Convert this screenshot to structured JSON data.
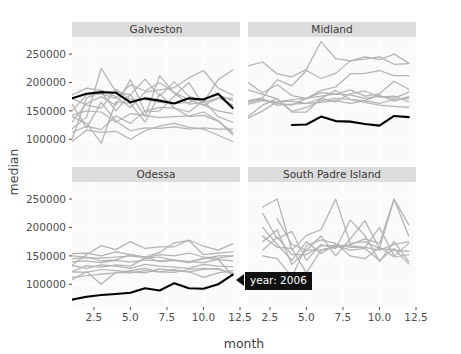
{
  "chart_data": {
    "type": "line",
    "title": "",
    "xlabel": "month",
    "ylabel": "median",
    "xlim": [
      1,
      12.5
    ],
    "ylim": [
      60000,
      280000
    ],
    "xticks": [
      "2.5",
      "5.0",
      "7.5",
      "10.0",
      "12.5"
    ],
    "xtick_values": [
      2.5,
      5.0,
      7.5,
      10.0,
      12.5
    ],
    "yticks": [
      "100000",
      "150000",
      "200000",
      "250000"
    ],
    "ytick_values": [
      100000,
      150000,
      200000,
      250000
    ],
    "grid": true,
    "legend": "none",
    "facet_layout": "2x2",
    "highlight_series": "2006",
    "highlight_color": "#000000",
    "other_series_color": "#b3b3b3",
    "panel_background": "#fafafa",
    "strip_background": "#dcdcdc",
    "x": [
      1,
      2,
      3,
      4,
      5,
      6,
      7,
      8,
      9,
      10,
      11,
      12
    ],
    "panels": [
      {
        "name": "Galveston",
        "series": [
          {
            "name": "2006",
            "highlight": true,
            "values": [
              172000,
              180000,
              183000,
              182000,
              165000,
              172000,
              168000,
              163000,
              172000,
              170000,
              180000,
              155000
            ]
          },
          {
            "name": "y1",
            "highlight": false,
            "values": [
              150000,
              178000,
              180000,
              172000,
              196000,
              185000,
              200000,
              182000,
              170000,
              160000,
              172000,
              172000
            ]
          },
          {
            "name": "y2",
            "highlight": false,
            "values": [
              118000,
              139000,
              225000,
              184000,
              178000,
              206000,
              176000,
              201000,
              176000,
              165000,
              205000,
              222000
            ]
          },
          {
            "name": "y3",
            "highlight": false,
            "values": [
              178000,
              190000,
              186000,
              175000,
              156000,
              183000,
              187000,
              191000,
              208000,
              221000,
              190000,
              178000
            ]
          },
          {
            "name": "y4",
            "highlight": false,
            "values": [
              112000,
              123000,
              117000,
              141000,
              128000,
              150000,
              156000,
              155000,
              140000,
              142000,
              132000,
              112000
            ]
          },
          {
            "name": "y5",
            "highlight": false,
            "values": [
              96000,
              116000,
              112000,
              114000,
              100000,
              115000,
              123000,
              128000,
              121000,
              118000,
              107000,
              96000
            ]
          },
          {
            "name": "y6",
            "highlight": false,
            "values": [
              140000,
              128000,
              93000,
              166000,
              163000,
              130000,
              180000,
              155000,
              148000,
              168000,
              140000,
              130000
            ]
          },
          {
            "name": "y7",
            "highlight": false,
            "values": [
              130000,
              163000,
              175000,
              160000,
              205000,
              148000,
              150000,
              176000,
              200000,
              160000,
              150000,
              145000
            ]
          },
          {
            "name": "y8",
            "highlight": false,
            "values": [
              162000,
              120000,
              165000,
              132000,
              115000,
              120000,
              119000,
              122000,
              118000,
              120000,
              118000,
              118000
            ]
          },
          {
            "name": "y9",
            "highlight": false,
            "values": [
              100000,
              173000,
              183000,
              150000,
              179000,
              140000,
              212000,
              181000,
              162000,
              165000,
              173000,
              160000
            ]
          },
          {
            "name": "y10",
            "highlight": false,
            "values": [
              172000,
              160000,
              155000,
              188000,
              170000,
              170000,
              165000,
              163000,
              165000,
              172000,
              178000,
              168000
            ]
          },
          {
            "name": "y11",
            "highlight": false,
            "values": [
              142000,
              150000,
              148000,
              130000,
              145000,
              142000,
              138000,
              140000,
              141000,
              148000,
              133000,
              108000
            ]
          }
        ]
      },
      {
        "name": "Midland",
        "series": [
          {
            "name": "2006",
            "highlight": true,
            "start_month": 4,
            "values": [
              null,
              null,
              null,
              125000,
              126000,
              140000,
              132000,
              131000,
              127000,
              124000,
              141000,
              139000
            ]
          },
          {
            "name": "y1",
            "highlight": false,
            "values": [
              229000,
              236000,
              215000,
              210000,
              223000,
              272000,
              242000,
              238000,
              241000,
              245000,
              232000,
              233000
            ]
          },
          {
            "name": "y2",
            "highlight": false,
            "values": [
              168000,
              173000,
              205000,
              194000,
              221000,
              207000,
              216000,
              238000,
              245000,
              240000,
              250000,
              234000
            ]
          },
          {
            "name": "y3",
            "highlight": false,
            "values": [
              200000,
              182000,
              196000,
              177000,
              172000,
              186000,
              192000,
              215000,
              216000,
              221000,
              212000,
              212000
            ]
          },
          {
            "name": "y4",
            "highlight": false,
            "values": [
              165000,
              170000,
              163000,
              160000,
              172000,
              182000,
              179000,
              187000,
              176000,
              180000,
              202000,
              188000
            ]
          },
          {
            "name": "y5",
            "highlight": false,
            "values": [
              162000,
              168000,
              166000,
              170000,
              172000,
              176000,
              180000,
              178000,
              172000,
              176000,
              172000,
              183000
            ]
          },
          {
            "name": "y6",
            "highlight": false,
            "values": [
              140000,
              160000,
              172000,
              149000,
              156000,
              168000,
              172000,
              170000,
              168000,
              178000,
              167000,
              175000
            ]
          },
          {
            "name": "y7",
            "highlight": false,
            "values": [
              187000,
              179000,
              171000,
              148000,
              148000,
              172000,
              166000,
              180000,
              185000,
              174000,
              176000,
              166000
            ]
          },
          {
            "name": "y8",
            "highlight": false,
            "values": [
              167000,
              171000,
              160000,
              162000,
              163000,
              165000,
              168000,
              163000,
              168000,
              163000,
              170000,
              172000
            ]
          },
          {
            "name": "y9",
            "highlight": false,
            "values": [
              137000,
              150000,
              166000,
              167000,
              163000,
              172000,
              186000,
              170000,
              165000,
              160000,
              158000,
              156000
            ]
          }
        ]
      },
      {
        "name": "Odessa",
        "series": [
          {
            "name": "2006",
            "highlight": true,
            "values": [
              73000,
              78000,
              81000,
              83000,
              85000,
              93000,
              89000,
              102000,
              93000,
              92000,
              100000,
              117000
            ]
          },
          {
            "name": "y1",
            "highlight": false,
            "values": [
              134000,
              152000,
              168000,
              161000,
              175000,
              163000,
              166000,
              166000,
              178000,
              167000,
              160000,
              171000
            ]
          },
          {
            "name": "y2",
            "highlight": false,
            "values": [
              154000,
              155000,
              150000,
              157000,
              152000,
              148000,
              156000,
              173000,
              177000,
              152000,
              155000,
              157000
            ]
          },
          {
            "name": "y3",
            "highlight": false,
            "values": [
              145000,
              147000,
              146000,
              148000,
              150000,
              147000,
              152000,
              150000,
              155000,
              148000,
              146000,
              150000
            ]
          },
          {
            "name": "y4",
            "highlight": false,
            "values": [
              140000,
              141000,
              138000,
              142000,
              139000,
              143000,
              141000,
              143000,
              140000,
              138000,
              144000,
              141000
            ]
          },
          {
            "name": "y5",
            "highlight": false,
            "values": [
              122000,
              133000,
              130000,
              134000,
              132000,
              146000,
              148000,
              142000,
              140000,
              145000,
              150000,
              150000
            ]
          },
          {
            "name": "y6",
            "highlight": false,
            "values": [
              108000,
              122000,
              100000,
              121000,
              120000,
              124000,
              122000,
              126000,
              122000,
              112000,
              120000,
              124000
            ]
          },
          {
            "name": "y7",
            "highlight": false,
            "values": [
              112000,
              115000,
              118000,
              120000,
              124000,
              128000,
              122000,
              121000,
              126000,
              128000,
              126000,
              120000
            ]
          },
          {
            "name": "y8",
            "highlight": false,
            "values": [
              133000,
              128000,
              134000,
              132000,
              128000,
              135000,
              132000,
              130000,
              128000,
              135000,
              132000,
              131000
            ]
          },
          {
            "name": "y9",
            "highlight": false,
            "values": [
              122000,
              121000,
              126000,
              124000,
              122000,
              120000,
              127000,
              124000,
              122000,
              126000,
              128000,
              118000
            ]
          },
          {
            "name": "y10",
            "highlight": false,
            "values": [
              150000,
              148000,
              141000,
              143000,
              152000,
              148000,
              140000,
              142000,
              138000,
              146000,
              144000,
              115000
            ]
          }
        ]
      },
      {
        "name": "South Padre Island",
        "series": [
          {
            "name": "y1",
            "highlight": false,
            "start_month": 2,
            "values": [
              null,
              236000,
              250000,
              160000,
              186000,
              196000,
              250000,
              172000,
              175000,
              163000,
              250000,
              205000
            ]
          },
          {
            "name": "y2",
            "highlight": false,
            "start_month": 2,
            "values": [
              null,
              225000,
              180000,
              193000,
              142000,
              170000,
              163000,
              213000,
              186000,
              140000,
              175000,
              140000
            ]
          },
          {
            "name": "y3",
            "highlight": false,
            "start_month": 2,
            "values": [
              null,
              200000,
              170000,
              142000,
              175000,
              154000,
              170000,
              165000,
              165000,
              200000,
              150000,
              172000
            ]
          },
          {
            "name": "y4",
            "highlight": false,
            "start_month": 2,
            "values": [
              null,
              185000,
              165000,
              163000,
              120000,
              160000,
              167000,
              170000,
              180000,
              172000,
              250000,
              185000
            ]
          },
          {
            "name": "y5",
            "highlight": false,
            "start_month": 2,
            "values": [
              null,
              175000,
              196000,
              135000,
              160000,
              160000,
              165000,
              168000,
              165000,
              160000,
              170000,
              175000
            ]
          },
          {
            "name": "y6",
            "highlight": false,
            "start_month": 2,
            "values": [
              null,
              160000,
              183000,
              152000,
              152000,
              168000,
              168000,
              160000,
              163000,
              142000,
              163000,
              136000
            ]
          },
          {
            "name": "y7",
            "highlight": false,
            "start_month": 2,
            "values": [
              null,
              150000,
              145000,
              113000,
              168000,
              178000,
              172000,
              150000,
              145000,
              165000,
              148000,
              152000
            ]
          },
          {
            "name": "y8",
            "highlight": false,
            "start_month": 3,
            "values": [
              null,
              null,
              215000,
              170000,
              160000,
              185000,
              150000,
              180000,
              212000,
              163000,
              160000,
              158000
            ]
          }
        ]
      }
    ]
  },
  "tooltip": {
    "label": "year: 2006",
    "background": "#111111",
    "color": "#ffffff"
  }
}
